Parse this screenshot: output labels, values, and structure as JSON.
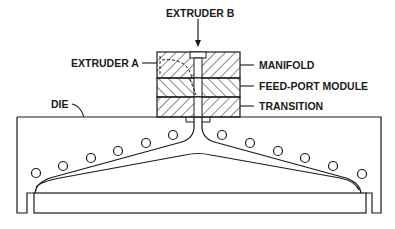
{
  "diagram": {
    "type": "die-cross-section",
    "labels": {
      "extruder_b": "EXTRUDER B",
      "extruder_a": "EXTRUDER A",
      "manifold": "MANIFOLD",
      "feed_port_module": "FEED-PORT MODULE",
      "transition": "TRANSITION",
      "die": "DIE"
    },
    "colors": {
      "line": "#1a1a1a",
      "background": "#ffffff"
    },
    "heater_count": 12
  }
}
